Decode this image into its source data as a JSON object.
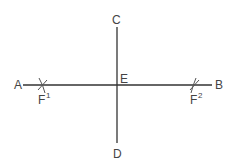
{
  "diagram": {
    "type": "perpendicular-bisector-construction",
    "colors": {
      "line": "#333333",
      "arc": "#555555",
      "label": "#444444"
    },
    "lines": [
      {
        "name": "AB",
        "from": [
          23,
          85
        ],
        "to": [
          212,
          85
        ]
      },
      {
        "name": "CD",
        "from": [
          117,
          27
        ],
        "to": [
          117,
          143
        ]
      }
    ],
    "points": {
      "A": {
        "label": "A",
        "x": 14,
        "y": 89
      },
      "B": {
        "label": "B",
        "x": 215,
        "y": 89
      },
      "C": {
        "label": "C",
        "x": 112,
        "y": 24
      },
      "D": {
        "label": "D",
        "x": 113,
        "y": 158
      },
      "E": {
        "label": "E",
        "x": 120,
        "y": 83
      },
      "F1": {
        "label": "F",
        "sup": "1",
        "x": 38,
        "y": 104
      },
      "F2": {
        "label": "F",
        "sup": "2",
        "x": 190,
        "y": 104
      }
    },
    "arc_marks": [
      {
        "at": [
          42,
          85
        ]
      },
      {
        "at": [
          194,
          85
        ]
      }
    ]
  }
}
